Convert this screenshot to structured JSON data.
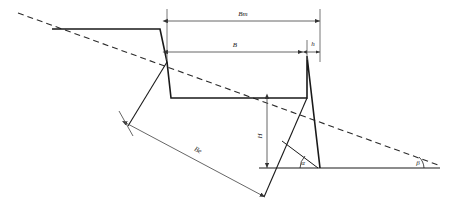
{
  "diagram": {
    "type": "engineering-cross-section",
    "labels": {
      "berm_width": "Bm",
      "bench_width": "B",
      "crest_offset": "h",
      "bench_height": "H",
      "overall_extent": "Be",
      "face_angle": "α",
      "slope_angle": "β"
    },
    "colors": {
      "profile_line": "#1a1a1a",
      "dimension_line": "#555555",
      "dashed_line": "#2b2b2b",
      "ground_line": "#1a1a1a",
      "background": "#ffffff"
    },
    "geometry": {
      "dashed_slope_start": [
        18,
        13
      ],
      "dashed_slope_end": [
        441,
        166
      ],
      "ground_line_y": 168,
      "ground_line_x_start": 259,
      "ground_line_x_end": 440,
      "profile_points": [
        [
          52,
          29
        ],
        [
          160,
          29
        ],
        [
          167,
          62
        ],
        [
          171,
          98
        ],
        [
          307,
          98
        ],
        [
          307,
          56
        ],
        [
          320,
          168
        ]
      ],
      "left_face_points": [
        [
          167,
          62
        ],
        [
          128,
          126
        ]
      ],
      "inner_face_points": [
        [
          307,
          98
        ],
        [
          282,
          141
        ],
        [
          264,
          197
        ]
      ],
      "dim_bm": {
        "y": 21,
        "x1": 167,
        "x2": 320
      },
      "dim_b": {
        "y": 52,
        "x1": 167,
        "x2": 307
      },
      "dim_h": {
        "y": 52,
        "x1": 307,
        "x2": 320
      },
      "dim_H": {
        "x": 267,
        "y1": 98,
        "y2": 168
      },
      "dim_Be": {
        "x1": 126,
        "y1": 123,
        "x2": 265,
        "y2": 197
      }
    }
  }
}
